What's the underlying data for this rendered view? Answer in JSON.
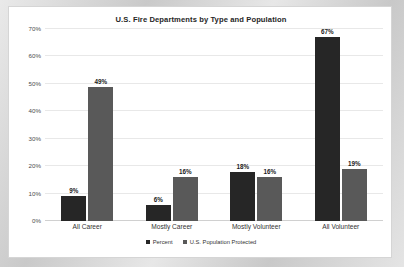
{
  "chart_data": {
    "type": "bar",
    "title": "U.S. Fire Departments by Type and Population",
    "xlabel": "",
    "ylabel": "",
    "ylim": [
      0,
      70
    ],
    "grid": true,
    "legend_position": "bottom",
    "categories": [
      "All Career",
      "Mostly Career",
      "Mostly Volunteer",
      "All Volunteer"
    ],
    "ytick_labels": [
      "0%",
      "10%",
      "20%",
      "30%",
      "40%",
      "50%",
      "60%",
      "70%"
    ],
    "ytick_values": [
      0,
      10,
      20,
      30,
      40,
      50,
      60,
      70
    ],
    "series": [
      {
        "name": "Percent",
        "color": "#262626",
        "values": [
          9,
          6,
          18,
          67
        ],
        "value_labels": [
          "9%",
          "6%",
          "18%",
          "67%"
        ]
      },
      {
        "name": "U.S. Population Protected",
        "color": "#595959",
        "values": [
          49,
          16,
          16,
          19
        ],
        "value_labels": [
          "49%",
          "16%",
          "16%",
          "19%"
        ]
      }
    ]
  }
}
